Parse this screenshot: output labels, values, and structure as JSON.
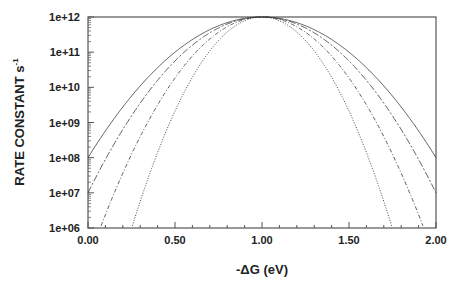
{
  "chart_data": {
    "type": "line",
    "title": "",
    "xlabel": "-ΔG  (eV)",
    "ylabel": "RATE CONSTANT  s",
    "ylabel_superscript": "-1",
    "xlim": [
      0.0,
      2.0
    ],
    "ylim": [
      1000000.0,
      1000000000000.0
    ],
    "yscale": "log",
    "grid": false,
    "legend": null,
    "x_ticks": [
      "0.00",
      "0.50",
      "1.00",
      "1.50",
      "2.00"
    ],
    "y_ticks": [
      "1e+06",
      "1e+07",
      "1e+08",
      "1e+09",
      "1e+10",
      "1e+11",
      "1e+12"
    ],
    "series": [
      {
        "name": "curve-1",
        "style": "solid",
        "peak_x": 1.0,
        "peak_y": 1000000000000.0,
        "x": [
          0.0,
          0.25,
          0.5,
          0.75,
          1.0,
          1.25,
          1.5,
          1.75,
          2.0
        ],
        "y": [
          100000000.0,
          1000000000.0,
          39800000000.0,
          400000000000.0,
          1000000000000.0,
          400000000000.0,
          39800000000.0,
          1000000000.0,
          100000000.0
        ]
      },
      {
        "name": "curve-2",
        "style": "dashed",
        "peak_x": 1.0,
        "peak_y": 1000000000000.0,
        "x": [
          0.0,
          0.25,
          0.5,
          0.75,
          1.0,
          1.25,
          1.5,
          1.75,
          2.0
        ],
        "y": [
          10000000.0,
          1780000000.0,
          56200000000.0,
          487000000000.0,
          1000000000000.0,
          487000000000.0,
          56200000000.0,
          1780000000.0,
          10000000.0
        ]
      },
      {
        "name": "curve-3",
        "style": "dash-dot",
        "peak_x": 1.0,
        "peak_y": 1000000000000.0,
        "x": [
          0.07,
          0.25,
          0.5,
          0.75,
          1.0,
          1.25,
          1.5,
          1.75,
          1.93
        ],
        "y": [
          1000000.0,
          630000000.0,
          13500000000.0,
          369000000000.0,
          1000000000000.0,
          369000000000.0,
          13500000000.0,
          630000000.0,
          1000000.0
        ]
      },
      {
        "name": "curve-4",
        "style": "dotted",
        "peak_x": 1.0,
        "peak_y": 1000000000000.0,
        "x": [
          0.25,
          0.5,
          0.75,
          1.0,
          1.25,
          1.5,
          1.75
        ],
        "y": [
          1000000.0,
          4500000000.0,
          215000000000.0,
          1000000000000.0,
          215000000000.0,
          4500000000.0,
          1000000.0
        ]
      }
    ],
    "series_params": [
      {
        "name": "curve-1",
        "decades_drop_per_unit_sq": 4.0
      },
      {
        "name": "curve-2",
        "decades_drop_per_unit_sq": 5.0
      },
      {
        "name": "curve-3",
        "decades_drop_per_unit_sq": 6.94
      },
      {
        "name": "curve-4",
        "decades_drop_per_unit_sq": 10.7
      }
    ]
  },
  "layout": {
    "plot_left": 88,
    "plot_right": 436,
    "plot_top": 17,
    "plot_bottom": 228,
    "line_color": "#333333",
    "frame_color": "#555555"
  }
}
